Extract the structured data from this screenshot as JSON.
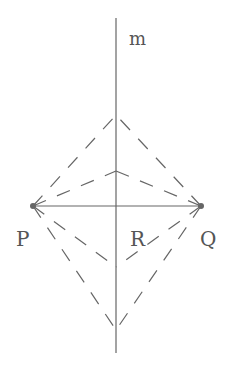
{
  "diagram": {
    "labels": {
      "line": "m",
      "left_point": "P",
      "right_point": "Q",
      "intersection": "R"
    },
    "colors": {
      "line": "#666666",
      "background": "#ffffff"
    },
    "geometry": {
      "line_m": {
        "x": 116,
        "y1": 18,
        "y2": 353
      },
      "segment_PQ": {
        "y": 206,
        "x1": 33,
        "x2": 201
      },
      "apexes_on_m": [
        115,
        171,
        267,
        330
      ]
    }
  }
}
